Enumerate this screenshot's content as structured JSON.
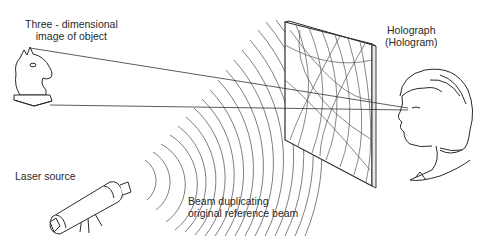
{
  "labels": {
    "object": {
      "line1": "Three - dimensional",
      "line2": "image of object"
    },
    "hologram": {
      "line1": "Holograph",
      "line2": "(Hologram)"
    },
    "laser": {
      "line1": "Laser source"
    },
    "beam": {
      "line1": "Beam duplicating",
      "line2": "original reference beam"
    }
  },
  "figures": [
    {
      "name": "chess-knight",
      "role": "virtual 3D image of object"
    },
    {
      "name": "hologram-plate",
      "role": "holograph interference plate"
    },
    {
      "name": "viewer-face",
      "role": "observer"
    },
    {
      "name": "laser",
      "role": "laser source on tripod"
    },
    {
      "name": "wavefronts",
      "role": "reference beam wavefronts"
    }
  ],
  "colors": {
    "line": "#333333",
    "wave": "#6a6a6a",
    "text": "#2a2a2a",
    "background": "#ffffff"
  }
}
